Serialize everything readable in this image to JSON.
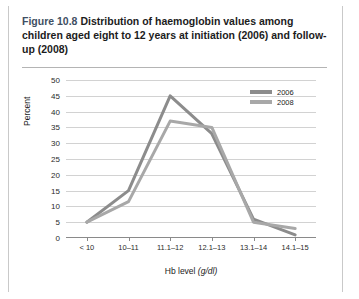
{
  "figure": {
    "number": "Figure 10.8",
    "title": "Distribution of haemoglobin values among children aged eight to 12 years at initiation (2006) and follow-up (2008)"
  },
  "chart_data": {
    "type": "line",
    "title": "Distribution of haemoglobin values among children aged eight to 12 years at initiation (2006) and follow-up (2008)",
    "xlabel_text": "Hb level",
    "xlabel_units": "(g/dl)",
    "ylabel": "Percent",
    "categories": [
      "< 10",
      "10–11",
      "11.1–12",
      "12.1–13",
      "13.1–14",
      "14.1–15"
    ],
    "series": [
      {
        "name": "2006",
        "color": "#8c8c8c",
        "values": [
          5,
          15,
          45,
          33,
          6,
          1
        ]
      },
      {
        "name": "2008",
        "color": "#a8a8a8",
        "values": [
          5,
          11.5,
          37,
          35,
          5,
          3
        ]
      }
    ],
    "ylim": [
      0,
      50
    ],
    "yticks": [
      0,
      5,
      10,
      15,
      20,
      25,
      30,
      35,
      40,
      45,
      50
    ],
    "grid": true,
    "legend_position": "top-right"
  }
}
